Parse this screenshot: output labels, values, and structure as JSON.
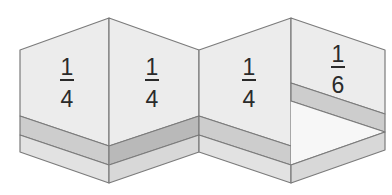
{
  "diagram": {
    "panels": [
      {
        "numerator": "1",
        "denominator": "4"
      },
      {
        "numerator": "1",
        "denominator": "4"
      },
      {
        "numerator": "1",
        "denominator": "4"
      },
      {
        "numerator": "1",
        "denominator": "6"
      }
    ],
    "colors": {
      "wall": "#ececec",
      "band": "#cdcdcd",
      "band_dark": "#b9b9b9",
      "base": "#e2e2e2",
      "floor": "#ffffff",
      "stroke": "#7b7b7b",
      "text": "#2a2a2a"
    }
  }
}
